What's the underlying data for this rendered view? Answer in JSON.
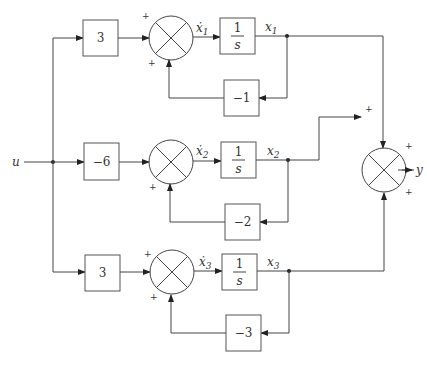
{
  "diagram": {
    "type": "block-diagram",
    "input": "u",
    "output": "y",
    "rows": [
      {
        "gain": "3",
        "state_dot": "ẋ",
        "sub": "1",
        "integrator_num": "1",
        "integrator_den": "s",
        "state": "x",
        "feedback": "−1",
        "sum_top_sign": "+",
        "sum_bottom_sign": "+"
      },
      {
        "gain": "−6",
        "state_dot": "ẋ",
        "sub": "2",
        "integrator_num": "1",
        "integrator_den": "s",
        "state": "x",
        "feedback": "−2",
        "sum_top_sign": "",
        "sum_bottom_sign": "+"
      },
      {
        "gain": "3",
        "state_dot": "ẋ",
        "sub": "3",
        "integrator_num": "1",
        "integrator_den": "s",
        "state": "x",
        "feedback": "−3",
        "sum_top_sign": "+",
        "sum_bottom_sign": "+"
      }
    ],
    "output_sum_signs": {
      "top": "+",
      "left": "+",
      "bottom": "+"
    }
  }
}
